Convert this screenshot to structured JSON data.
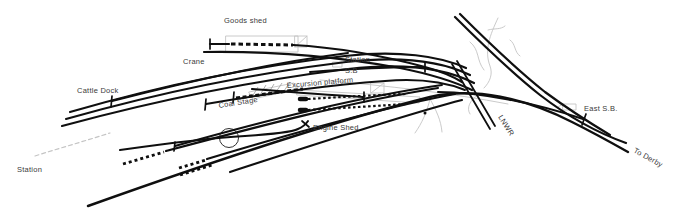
{
  "canvas": {
    "width": 678,
    "height": 210,
    "background": "#ffffff",
    "track_color": "#0f0f0f",
    "faint_color": "#c4c4c4",
    "hatch_color": "#9a9a9a",
    "label_color": "#3a3a3a",
    "label_font_size": 7.5
  },
  "labels": [
    {
      "name": "label-goods-shed",
      "text": "Goods shed",
      "x": 224,
      "y": 23,
      "rotate": 0
    },
    {
      "name": "label-crane",
      "text": "Crane",
      "x": 183,
      "y": 64,
      "rotate": 0
    },
    {
      "name": "label-cattle-dock",
      "text": "Cattle Dock",
      "x": 77,
      "y": 93,
      "rotate": 0
    },
    {
      "name": "label-station-sb-line1",
      "text": "Station",
      "x": 345,
      "y": 62,
      "rotate": 0
    },
    {
      "name": "label-station-sb-line2",
      "text": "S.B",
      "x": 345,
      "y": 73,
      "rotate": 0
    },
    {
      "name": "label-excursion-platform",
      "text": "Excursion platform",
      "x": 287,
      "y": 88,
      "rotate": -5
    },
    {
      "name": "label-coal-stage",
      "text": "Coal Stage",
      "x": 219,
      "y": 108,
      "rotate": -9
    },
    {
      "name": "label-engine-shed",
      "text": "Engine Shed",
      "x": 313,
      "y": 130,
      "rotate": 0
    },
    {
      "name": "label-station-west",
      "text": "Station",
      "x": 17,
      "y": 172,
      "rotate": 0
    },
    {
      "name": "label-lnwr",
      "text": "LNWR",
      "x": 498,
      "y": 117,
      "rotate": 58
    },
    {
      "name": "label-east-sb",
      "text": "East S.B.",
      "x": 584,
      "y": 111,
      "rotate": 0
    },
    {
      "name": "label-to-derby",
      "text": "To Derby",
      "x": 633,
      "y": 152,
      "rotate": 29
    }
  ],
  "faint": [
    {
      "name": "goods-shed-outline",
      "d": "M 226 36 L 298 36 L 298 52 L 226 52 Z",
      "width": 0.9
    },
    {
      "name": "goods-shed-end-box",
      "d": "M 295 36 L 307 36 L 307 47 L 295 47 Z M 295 47 L 307 36",
      "width": 0.9
    },
    {
      "name": "excursion-platform-outline",
      "d": "M 298 90 L 420 97 L 419 103 L 297 95 Z",
      "width": 0.9
    },
    {
      "name": "signal-box-symbol",
      "d": "M 371 83 L 384 83 L 384 93 L 371 93 Z M 371 93 L 384 83",
      "width": 0.9
    },
    {
      "name": "station-sb-symbol",
      "d": "M 333 62 L 342 62 L 342 67 L 333 67 Z",
      "width": 0.9
    },
    {
      "name": "east-sb-symbol",
      "d": "M 563 104 L 576 104 L 576 110 L 563 110 Z M 558 107 L 563 104",
      "width": 0.9
    },
    {
      "name": "coal-stage-outline",
      "d": "M 249 92 L 294 83 L 298 89 L 253 99 Z",
      "width": 0.9
    },
    {
      "name": "field-curve-1",
      "d": "M 320 80 C 390 86, 450 93, 508 104",
      "width": 0.9
    },
    {
      "name": "road-fork-left",
      "d": "M 430 99 C 427 112, 422 123, 415 133",
      "width": 0.9
    },
    {
      "name": "road-fork-right",
      "d": "M 430 99 C 436 110, 441 120, 442 132",
      "width": 0.9
    },
    {
      "name": "stream-1",
      "d": "M 498 18 C 490 35, 484 50, 490 66 C 493 74, 490 82, 484 88",
      "width": 0.9
    },
    {
      "name": "stream-2",
      "d": "M 470 42 C 480 50, 476 60, 484 70",
      "width": 0.9
    },
    {
      "name": "stream-twig-1",
      "d": "M 488 30 C 495 28, 500 30, 505 26",
      "width": 0.9
    },
    {
      "name": "stream-twig-2",
      "d": "M 478 95 C 470 100, 466 108, 470 114",
      "width": 0.9
    },
    {
      "name": "stream-twig-3",
      "d": "M 510 40 C 516 44, 514 52, 520 56",
      "width": 0.9
    },
    {
      "name": "faded-road-dashed",
      "d": "M 35 156 C 60 148, 85 141, 110 133",
      "width": 1.2,
      "dash": "4 3"
    }
  ],
  "hatches": [
    {
      "name": "coal-stage-hatch-1",
      "d": "M 252 97 L 258 87"
    },
    {
      "name": "coal-stage-hatch-2",
      "d": "M 260 95 L 266 85"
    },
    {
      "name": "coal-stage-hatch-3",
      "d": "M 268 94 L 274 84"
    },
    {
      "name": "coal-stage-hatch-4",
      "d": "M 276 92 L 282 83"
    },
    {
      "name": "coal-stage-hatch-5",
      "d": "M 284 91 L 290 82"
    }
  ],
  "turntable": {
    "name": "turntable-circle",
    "cx": 229,
    "cy": 138,
    "r": 9.5,
    "stroke": "#1a1a1a",
    "width": 0.9
  },
  "dot": {
    "name": "survey-dot",
    "cx": 425,
    "cy": 113,
    "r": 1.5
  },
  "tracks": [
    {
      "name": "main-line-west-to-derby",
      "d": "M 88 206 C 200 166, 330 122, 430 97 C 475 87, 525 98, 572 122 C 596 134, 612 143, 628 152",
      "width": 2.4
    },
    {
      "name": "branch-northeast-1",
      "d": "M 455 17 C 480 42, 510 71, 540 95 C 566 115, 598 133, 626 143",
      "width": 2.2
    },
    {
      "name": "branch-northeast-2",
      "d": "M 460 14 C 485 39, 515 68, 545 92 C 568 109, 590 123, 610 135",
      "width": 2.2
    },
    {
      "name": "east-buffer-siding",
      "d": "M 438 92 C 480 92, 535 103, 583 119",
      "width": 2
    },
    {
      "name": "lnwr-crossing-1",
      "d": "M 452 64 L 490 129",
      "width": 1.8
    },
    {
      "name": "lnwr-crossing-2",
      "d": "M 457 61 L 495 126",
      "width": 1.8
    },
    {
      "name": "goods-shed-siding-left",
      "d": "M 210 44 L 229 44",
      "width": 2.2
    },
    {
      "name": "goods-shed-siding-dashed",
      "d": "M 231 44 L 293 45",
      "width": 3,
      "dash": "4.5 3"
    },
    {
      "name": "goods-shed-siding-right",
      "d": "M 293 45 C 330 47, 380 55, 425 67 C 440 71, 452 76, 462 82",
      "width": 2.2
    },
    {
      "name": "goods-yard-line-2",
      "d": "M 204 52 C 270 51, 340 57, 400 68 C 430 74, 455 82, 472 90",
      "width": 2.2
    },
    {
      "name": "cattle-dock-siding",
      "d": "M 112 101 C 190 81, 270 63, 348 53",
      "width": 2
    },
    {
      "name": "crane-road-1",
      "d": "M 70 112 C 160 86, 255 66, 345 56 C 398 50, 440 56, 466 68",
      "width": 2.2
    },
    {
      "name": "crane-road-2",
      "d": "M 66 119 C 158 93, 256 73, 346 62 C 398 56, 441 61, 470 75",
      "width": 2.2
    },
    {
      "name": "crane-road-3",
      "d": "M 62 126 C 158 100, 258 80, 348 69 C 400 63, 443 67, 474 83",
      "width": 2.2
    },
    {
      "name": "mid-siding",
      "d": "M 206 104 C 270 93, 330 85, 385 81 C 420 78, 445 82, 465 90",
      "width": 2
    },
    {
      "name": "coal-stage-dashed",
      "d": "M 236 98 C 260 95, 280 92, 303 89",
      "width": 3,
      "dash": "4 2.5"
    },
    {
      "name": "excursion-platform-track",
      "d": "M 252 89 C 290 92, 330 95, 363 97",
      "width": 2.2
    },
    {
      "name": "excursion-dashed-1",
      "d": "M 308 99 C 342 97, 375 95, 406 94",
      "width": 2.2,
      "dash": "2.5 2.5"
    },
    {
      "name": "excursion-dashed-1-head",
      "d": "M 300 99 L 306 99",
      "width": 4.5
    },
    {
      "name": "excursion-dashed-2",
      "d": "M 308 110 C 342 108, 375 106, 406 104",
      "width": 2.2,
      "dash": "2.5 2.5"
    },
    {
      "name": "excursion-dashed-2-head",
      "d": "M 300 110 L 306 110",
      "width": 4.5
    },
    {
      "name": "fan-line-2",
      "d": "M 230 172 C 310 146, 400 116, 462 100",
      "width": 2.2
    },
    {
      "name": "fan-line-3",
      "d": "M 207 159 C 300 131, 390 106, 455 94",
      "width": 2.2
    },
    {
      "name": "fan-line-3-dashed",
      "d": "M 179 168 L 206 160",
      "width": 2.8,
      "dash": "3 3"
    },
    {
      "name": "fan-line-3b-dashed",
      "d": "M 180 175 L 212 165",
      "width": 2.8,
      "dash": "3 3"
    },
    {
      "name": "fan-line-4",
      "d": "M 166 151 C 260 126, 350 102, 438 88",
      "width": 2.2
    },
    {
      "name": "fan-line-4-dashed",
      "d": "M 123 164 L 164 152",
      "width": 2.8,
      "dash": "3 3"
    },
    {
      "name": "fan-line-5",
      "d": "M 175 146 C 268 120, 358 97, 442 85",
      "width": 2
    },
    {
      "name": "engine-shed-road",
      "d": "M 120 150 C 170 143, 210 138, 245 136 C 275 134, 292 132, 298 129 C 303 127, 306 124, 308 121",
      "width": 2
    },
    {
      "name": "station-sb-track",
      "d": "M 310 72 C 350 69, 390 67, 424 67",
      "width": 2
    }
  ],
  "ticks": [
    {
      "name": "goods-siding-buffer",
      "d": "M 210 39 L 210 49"
    },
    {
      "name": "cattle-siding-buffer",
      "d": "M 112 96 L 111 107"
    },
    {
      "name": "mid-siding-buffer",
      "d": "M 206 99 L 205 110"
    },
    {
      "name": "coal-siding-buffer",
      "d": "M 234 92 L 233 103"
    },
    {
      "name": "excursion-track-buffer",
      "d": "M 364 92 L 364 102"
    },
    {
      "name": "station-sb-track-buffer",
      "d": "M 425 62 L 425 72"
    },
    {
      "name": "east-siding-buffer",
      "d": "M 586 114 L 582 125"
    },
    {
      "name": "fan-line-5-end",
      "d": "M 175 142 L 174 151"
    },
    {
      "name": "engine-road-end",
      "d": "M 302 121 L 309 127"
    }
  ]
}
